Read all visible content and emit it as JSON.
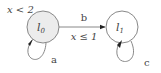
{
  "diagram": {
    "type": "timed-automaton",
    "states": [
      {
        "id": "l0",
        "label": "l",
        "sub": "0",
        "invariant": "x < 2",
        "initial": true,
        "fill": "#ececec"
      },
      {
        "id": "l1",
        "label": "l",
        "sub": "1",
        "fill": "#ffffff"
      }
    ],
    "edges": [
      {
        "from": "l0",
        "to": "l1",
        "action": "b",
        "guard": "x ≤ 1"
      },
      {
        "from": "l0",
        "to": "l0",
        "action": "a"
      },
      {
        "from": "l1",
        "to": "l1",
        "action": "c"
      }
    ],
    "colors": {
      "stroke": "#7a7a7a",
      "initial_fill": "#ececec",
      "text": "#444444"
    }
  }
}
